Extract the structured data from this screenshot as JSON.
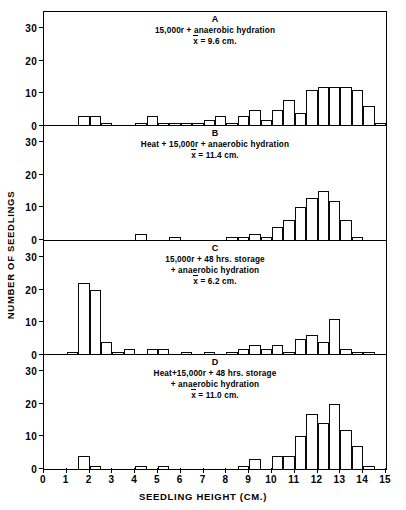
{
  "figure": {
    "xlabel": "SEEDLING HEIGHT (CM.)",
    "ylabel": "NUMBER OF SEEDLINGS",
    "xticks": [
      "0",
      "1",
      "2",
      "3",
      "4",
      "5",
      "6",
      "7",
      "8",
      "9",
      "10",
      "11",
      "12",
      "13",
      "14",
      "15"
    ],
    "yticks": [
      "0",
      "10",
      "20",
      "30"
    ]
  },
  "chart_data": {
    "type": "bar",
    "title": "",
    "xlabel": "SEEDLING HEIGHT (CM.)",
    "ylabel": "NUMBER OF SEEDLINGS",
    "xlim": [
      0,
      15
    ],
    "ylim": [
      0,
      35
    ],
    "bin_width": 0.5,
    "grid": false,
    "legend": "none",
    "panels": [
      {
        "letter": "A",
        "caption_line1": "15,000r + anaerobic hydration",
        "mean_symbol": "x",
        "mean_text": "= 9.6 cm.",
        "mean_value": 9.6,
        "yticks": [
          0,
          10,
          20,
          30
        ],
        "bin_starts": [
          1.5,
          2.0,
          2.5,
          4.0,
          4.5,
          5.0,
          5.5,
          6.0,
          6.5,
          7.0,
          7.5,
          8.0,
          8.5,
          9.0,
          9.5,
          10.0,
          10.5,
          11.0,
          11.5,
          12.0,
          12.5,
          13.0,
          13.5,
          14.0
        ],
        "values": [
          3,
          3,
          1,
          1,
          3,
          1,
          1,
          1,
          1,
          2,
          3,
          1,
          3,
          5,
          2,
          5,
          8,
          4,
          11,
          12,
          12,
          12,
          11,
          6
        ],
        "extra_bins": [
          14.5
        ],
        "extra_values": [
          1
        ]
      },
      {
        "letter": "B",
        "caption_line1": "Heat + 15,000r + anaerobic hydration",
        "mean_symbol": "x",
        "mean_text": "= 11.4 cm.",
        "mean_value": 11.4,
        "yticks": [
          0,
          10,
          20,
          30
        ],
        "bin_starts": [
          4.0,
          5.5,
          8.0,
          8.5,
          9.0,
          9.5,
          10.0,
          10.5,
          11.0,
          11.5,
          12.0,
          12.5,
          13.0,
          13.5
        ],
        "values": [
          2,
          1,
          1,
          1,
          2,
          1,
          4,
          6,
          10,
          13,
          15,
          12,
          6,
          1
        ],
        "extra_bins": [],
        "extra_values": []
      },
      {
        "letter": "C",
        "caption_line1": "15,000r + 48 hrs. storage",
        "caption_line2": "+ anaerobic hydration",
        "mean_symbol": "x",
        "mean_text": "= 6.2 cm.",
        "mean_value": 6.2,
        "yticks": [
          0,
          10,
          20,
          30
        ],
        "bin_starts": [
          1.0,
          1.5,
          2.0,
          2.5,
          3.0,
          3.5,
          4.5,
          5.0,
          6.0,
          7.0,
          8.0,
          8.5,
          9.0,
          9.5,
          10.0,
          10.5,
          11.0,
          11.5,
          12.0,
          12.5,
          13.0,
          13.5,
          14.0
        ],
        "values": [
          1,
          22,
          20,
          4,
          1,
          2,
          2,
          2,
          1,
          1,
          1,
          2,
          3,
          2,
          3,
          1,
          5,
          6,
          4,
          11,
          2,
          1,
          1
        ],
        "extra_bins": [],
        "extra_values": []
      },
      {
        "letter": "D",
        "caption_line1": "Heat+15,000r + 48 hrs. storage",
        "caption_line2": "+ anaerobic hydration",
        "mean_symbol": "x",
        "mean_text": "= 11.0 cm.",
        "mean_value": 11.0,
        "yticks": [
          0,
          10,
          20,
          30
        ],
        "bin_starts": [
          1.5,
          2.0,
          4.0,
          5.0,
          8.5,
          9.0,
          10.0,
          10.5,
          11.0,
          11.5,
          12.0,
          12.5,
          13.0,
          13.5,
          14.0
        ],
        "values": [
          4,
          1,
          1,
          1,
          1,
          3,
          4,
          4,
          10,
          17,
          14,
          20,
          12,
          7,
          1
        ],
        "extra_bins": [],
        "extra_values": []
      }
    ]
  }
}
